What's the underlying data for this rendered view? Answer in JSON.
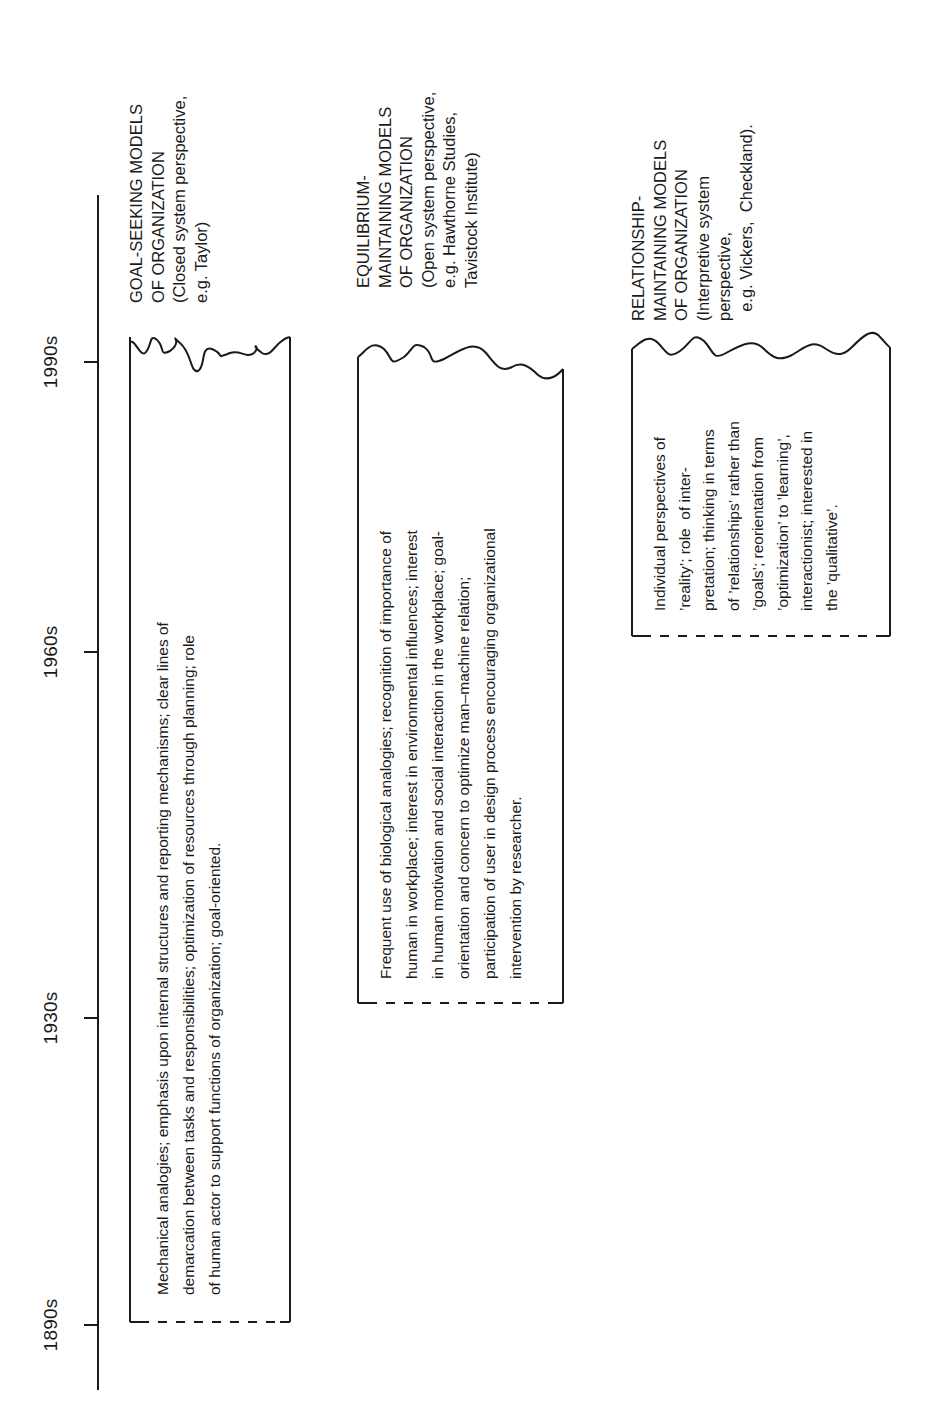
{
  "timeline": {
    "decades": [
      {
        "label": "1890s"
      },
      {
        "label": "1930s"
      },
      {
        "label": "1960s"
      },
      {
        "label": "1990s"
      }
    ]
  },
  "models": [
    {
      "heading": [
        "GOAL-SEEKING MODELS",
        "OF ORGANIZATION",
        "(Closed system perspective,",
        "e.g. Taylor)"
      ],
      "description": [
        "Mechanical analogies; emphasis upon internal structures and reporting mechanisms; clear lines of",
        "demarcation between tasks and responsibilities; optimization of resources through planning; role",
        "of human actor to support functions of organization; goal-oriented."
      ],
      "span": {
        "from": "1890s",
        "to": "1990s"
      }
    },
    {
      "heading": [
        "EQUILIBRIUM-",
        "MAINTAINING MODELS",
        "OF ORGANIZATION",
        "(Open system perspective,",
        "e.g. Hawthorne Studies,",
        "Tavistock Institute)"
      ],
      "description": [
        "Frequent use of biological analogies; recognition of importance of",
        "human in workplace; interest in environmental influences; interest",
        "in human motivation and social interaction in the workplace; goal-",
        "orientation and concern to optimize man–machine relation;",
        "participation of user in design process encouraging organizational",
        "intervention by researcher."
      ],
      "span": {
        "from": "1930s",
        "to": "1990s"
      }
    },
    {
      "heading": [
        "RELATIONSHIP-",
        "MAINTAINING MODELS",
        "OF ORGANIZATION",
        "(Interpretive system",
        "perspective,",
        "  e.g. Vickers,  Checkland)."
      ],
      "description": [
        "Individual perspectives of",
        "’reality’; role  of inter-",
        "pretation; thinking in terms",
        "of ’relationships’ rather than",
        "’goals’; reorientation from",
        "’optimization’ to ’learning’,",
        "interactionist; interested in",
        "the ’qualitative’."
      ],
      "span": {
        "from": "1960s",
        "to": "1990s"
      }
    }
  ],
  "colors": {
    "ink": "#1a1a1a",
    "background": "#ffffff"
  }
}
